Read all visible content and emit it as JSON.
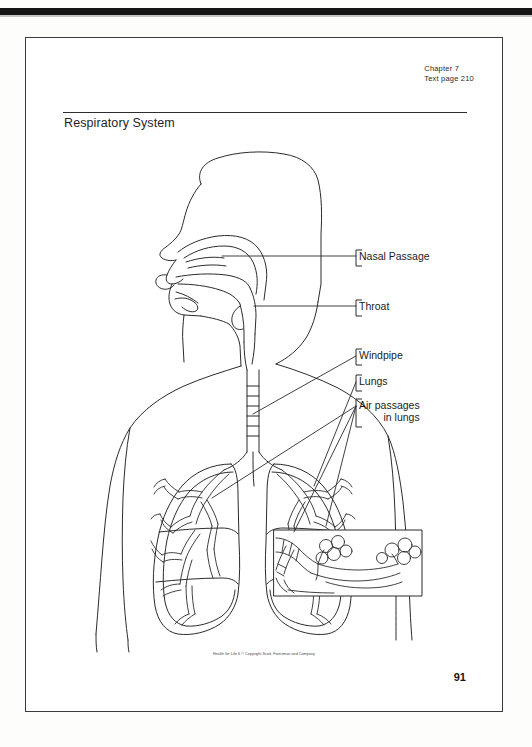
{
  "document": {
    "chapter": "Chapter 7",
    "text_page": "Text page 210",
    "title": "Respiratory System",
    "footer_credit": "Health for Life  6 © Copyright Scott, Foresman and Company",
    "page_number": "91"
  },
  "labels": {
    "nasal_passage": "Nasal Passage",
    "throat": "Throat",
    "windpipe": "Windpipe",
    "lungs": "Lungs",
    "air_passages_line1": "Air passages",
    "air_passages_line2": "in lungs"
  },
  "figure": {
    "caption": "human-respiratory-system-line-diagram",
    "inset_caption": "alveoli-detail-inset"
  },
  "colors": {
    "ink": "#1c1c1c",
    "line": "#3a3a3a",
    "paper": "#ffffff",
    "scan_bar": "#151515"
  }
}
